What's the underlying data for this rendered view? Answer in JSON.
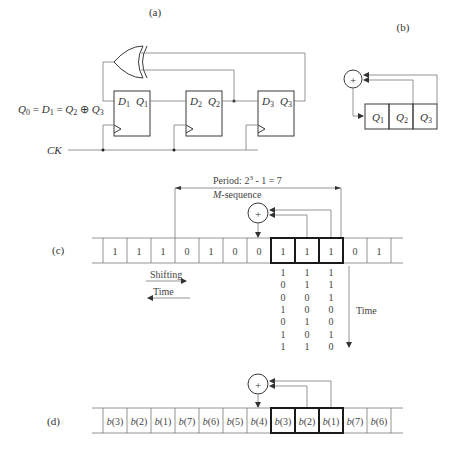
{
  "panels": {
    "a": {
      "label": "(a)",
      "equation": {
        "q0": "Q",
        "q0sub": "0",
        "eq1": " = ",
        "d1": "D",
        "d1sub": "1",
        "eq2": " = ",
        "q2": "Q",
        "q2sub": "2",
        "xor": " ⊕ ",
        "q3": "Q",
        "q3sub": "3"
      },
      "clock_label": "CK",
      "flip_flops": [
        {
          "d": "D",
          "dsub": "1",
          "q": "Q",
          "qsub": "1"
        },
        {
          "d": "D",
          "dsub": "2",
          "q": "Q",
          "qsub": "2"
        },
        {
          "d": "D",
          "dsub": "3",
          "q": "Q",
          "qsub": "3"
        }
      ],
      "gate": "xor-gate"
    },
    "b": {
      "label": "(b)",
      "register_cells": [
        {
          "name": "Q",
          "sub": "1"
        },
        {
          "name": "Q",
          "sub": "2"
        },
        {
          "name": "Q",
          "sub": "3"
        }
      ],
      "adder_symbol": "+"
    },
    "c": {
      "label": "(c)",
      "period_text": "Period: 2",
      "period_exp": "3",
      "period_rest": " - 1 = 7",
      "msequence_italic": "M",
      "msequence_rest": "-sequence",
      "adder_symbol": "+",
      "cells": [
        "1",
        "1",
        "1",
        "0",
        "1",
        "0",
        "0",
        "1",
        "1",
        "1",
        "0",
        "1"
      ],
      "register_start_index": 7,
      "shifting_label": "Shifting",
      "time_left_label": "Time",
      "time_down_label": "Time",
      "states": [
        [
          "1",
          "1",
          "1"
        ],
        [
          "0",
          "1",
          "1"
        ],
        [
          "0",
          "0",
          "1"
        ],
        [
          "1",
          "0",
          "0"
        ],
        [
          "0",
          "1",
          "0"
        ],
        [
          "1",
          "0",
          "1"
        ],
        [
          "1",
          "1",
          "0"
        ]
      ]
    },
    "d": {
      "label": "(d)",
      "adder_symbol": "+",
      "cells": [
        {
          "b": "b",
          "n": "(3)"
        },
        {
          "b": "b",
          "n": "(2)"
        },
        {
          "b": "b",
          "n": "(1)"
        },
        {
          "b": "b",
          "n": "(7)"
        },
        {
          "b": "b",
          "n": "(6)"
        },
        {
          "b": "b",
          "n": "(5)"
        },
        {
          "b": "b",
          "n": "(4)"
        },
        {
          "b": "b",
          "n": "(3)"
        },
        {
          "b": "b",
          "n": "(2)"
        },
        {
          "b": "b",
          "n": "(1)"
        },
        {
          "b": "b",
          "n": "(7)"
        },
        {
          "b": "b",
          "n": "(6)"
        }
      ],
      "register_start_index": 7
    }
  }
}
